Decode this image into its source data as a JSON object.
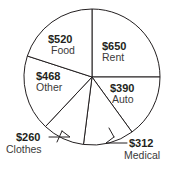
{
  "chart_data": {
    "type": "pie",
    "title": "",
    "subtitle": "",
    "xlabel": "",
    "ylabel": "",
    "currency": "$",
    "total": 2600,
    "legend_position": "none",
    "grid": false,
    "labels_inside": [
      "Rent",
      "Food",
      "Other",
      "Auto"
    ],
    "labels_outside": [
      "Clothes",
      "Medical"
    ],
    "start_angle_deg": 0,
    "direction": "clockwise",
    "categories": [
      "Rent",
      "Auto",
      "Medical",
      "Clothes",
      "Other",
      "Food"
    ],
    "values": [
      650,
      390,
      312,
      260,
      468,
      520
    ],
    "slices": [
      {
        "label": "Rent",
        "amount_text": "$650",
        "value": 650,
        "angle_deg": 90.0,
        "percent": 25.0
      },
      {
        "label": "Auto",
        "amount_text": "$390",
        "value": 390,
        "angle_deg": 54.0,
        "percent": 15.0
      },
      {
        "label": "Medical",
        "amount_text": "$312",
        "value": 312,
        "angle_deg": 43.2,
        "percent": 12.0
      },
      {
        "label": "Clothes",
        "amount_text": "$260",
        "value": 260,
        "angle_deg": 36.0,
        "percent": 10.0
      },
      {
        "label": "Other",
        "amount_text": "$468",
        "value": 468,
        "angle_deg": 64.8,
        "percent": 18.0
      },
      {
        "label": "Food",
        "amount_text": "$520",
        "value": 520,
        "angle_deg": 72.0,
        "percent": 20.0
      }
    ],
    "colors": {
      "slice_fill": "#ffffff",
      "outline": "#231f20",
      "amount_text": "#231f20",
      "category_text": "#3a3a3a",
      "background": "#ffffff"
    }
  }
}
